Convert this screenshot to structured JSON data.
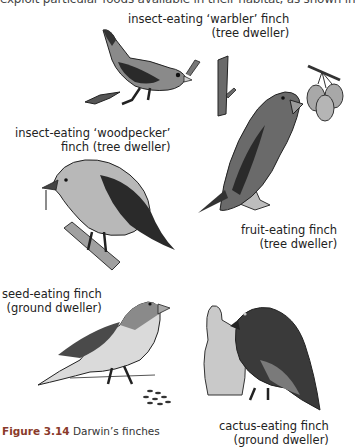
{
  "page": {
    "cut_off_text": "exploit particular foods available in their habitat, as shown in"
  },
  "birds": [
    {
      "id": "warbler",
      "label_line1": "insect-eating ‘warbler’ finch",
      "label_line2": "(tree dweller)"
    },
    {
      "id": "woodpecker",
      "label_line1": "insect-eating ‘woodpecker’",
      "label_line2": "finch (tree dweller)"
    },
    {
      "id": "fruit",
      "label_line1": "fruit-eating finch",
      "label_line2": "(tree dweller)"
    },
    {
      "id": "seed",
      "label_line1": "seed-eating finch",
      "label_line2": "(ground dweller)"
    },
    {
      "id": "cactus",
      "label_line1": "cactus-eating finch",
      "label_line2": "(ground dweller)"
    }
  ],
  "caption": {
    "figure_number": "Figure 3.14",
    "title": "Darwin’s finches"
  },
  "colors": {
    "dark": "#2a2a2a",
    "mid": "#6a6a6a",
    "light": "#a8a8a8",
    "pale": "#d6d6d6",
    "caption_accent": "#8a3a2a"
  }
}
